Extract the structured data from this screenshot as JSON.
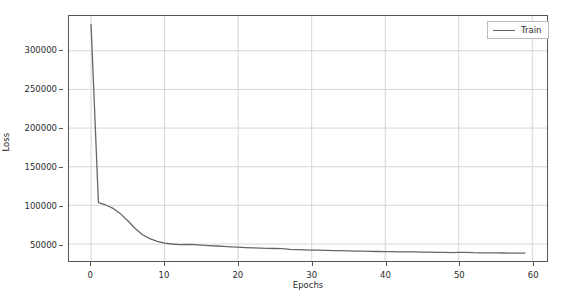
{
  "chart_data": {
    "type": "line",
    "title": "",
    "xlabel": "Epochs",
    "ylabel": "Loss",
    "xlim": [
      -3,
      62
    ],
    "ylim": [
      28000,
      345000
    ],
    "xticks": [
      0,
      10,
      20,
      30,
      40,
      50,
      60
    ],
    "yticks": [
      50000,
      100000,
      150000,
      200000,
      250000,
      300000
    ],
    "xticklabels": [
      "0",
      "10",
      "20",
      "30",
      "40",
      "50",
      "60"
    ],
    "yticklabels": [
      "50000",
      "100000",
      "150000",
      "200000",
      "250000",
      "300000"
    ],
    "grid": true,
    "legend_position": "upper right",
    "series": [
      {
        "name": "Train",
        "color": "#666666",
        "x": [
          0,
          1,
          2,
          3,
          4,
          5,
          6,
          7,
          8,
          9,
          10,
          11,
          12,
          13,
          14,
          15,
          16,
          17,
          18,
          19,
          20,
          21,
          22,
          23,
          24,
          25,
          26,
          27,
          28,
          29,
          30,
          31,
          32,
          33,
          34,
          35,
          36,
          37,
          38,
          39,
          40,
          41,
          42,
          43,
          44,
          45,
          46,
          47,
          48,
          49,
          50,
          51,
          52,
          53,
          54,
          55,
          56,
          57,
          58,
          59
        ],
        "values": [
          334000,
          103500,
          100500,
          96000,
          89000,
          80000,
          70000,
          62000,
          57000,
          53500,
          51200,
          50000,
          49300,
          49600,
          49200,
          48500,
          47900,
          47400,
          46900,
          46400,
          45900,
          45400,
          45000,
          44700,
          44400,
          44200,
          44000,
          43000,
          42600,
          42400,
          42200,
          42000,
          41800,
          41500,
          41300,
          41100,
          40900,
          40700,
          40500,
          40300,
          40200,
          40000,
          39900,
          39800,
          39700,
          39500,
          39400,
          39300,
          39100,
          38900,
          39200,
          39300,
          38800,
          38600,
          38500,
          38400,
          38350,
          38300,
          38250,
          38200
        ]
      }
    ]
  },
  "legend": {
    "entries": [
      {
        "label": "Train",
        "icon": "line-swatch"
      }
    ]
  },
  "axes": {
    "xlabel": "Epochs",
    "ylabel": "Loss"
  }
}
